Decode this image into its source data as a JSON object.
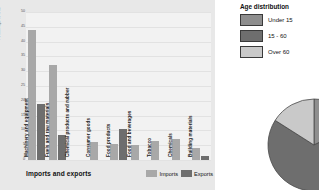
{
  "bar_panel": {
    "title": "Imports and exports",
    "yaxis_title": "Percentage of total",
    "legend": [
      {
        "label": "Imports",
        "color": "#a8a8a8"
      },
      {
        "label": "Exports",
        "color": "#6e6e6e"
      }
    ]
  },
  "pie_panel": {
    "title": "Age distribution",
    "legend": [
      {
        "label": "Under 15",
        "color": "#8e8e8e"
      },
      {
        "label": "15 - 60",
        "color": "#6e6e6e"
      },
      {
        "label": "Over 60",
        "color": "#c9c9c9"
      }
    ]
  },
  "chart_data": [
    {
      "type": "bar",
      "title": "Imports and exports",
      "xlabel": "",
      "ylabel": "Percentage of total",
      "ylim": [
        0,
        50
      ],
      "yticks": [
        0,
        5,
        10,
        15,
        20,
        25,
        30,
        35,
        40,
        45,
        50
      ],
      "grid": true,
      "legend_position": "bottom-right",
      "categories": [
        "Machinery and equipment",
        "Fuels and raw materials",
        "Chemical products and rubber",
        "Consumer goods",
        "Food products",
        "Food and beverages",
        "Tobacco",
        "Chemicals",
        "Building materials"
      ],
      "series": [
        {
          "name": "Imports",
          "color": "#a8a8a8",
          "values": [
            44,
            32,
            0,
            6,
            5.5,
            5,
            6.5,
            7,
            4
          ]
        },
        {
          "name": "Exports",
          "color": "#6e6e6e",
          "values": [
            19,
            8.5,
            0,
            0,
            10.5,
            0,
            0,
            0,
            1.5
          ]
        }
      ]
    },
    {
      "type": "pie",
      "title": "Age distribution",
      "labels": [
        "Under 15",
        "15 - 60",
        "Over 60"
      ],
      "values": [
        18,
        66,
        16
      ],
      "colors": [
        "#8e8e8e",
        "#6e6e6e",
        "#c9c9c9"
      ],
      "legend_position": "top",
      "note": "pie is clipped by the right edge of the image"
    }
  ]
}
